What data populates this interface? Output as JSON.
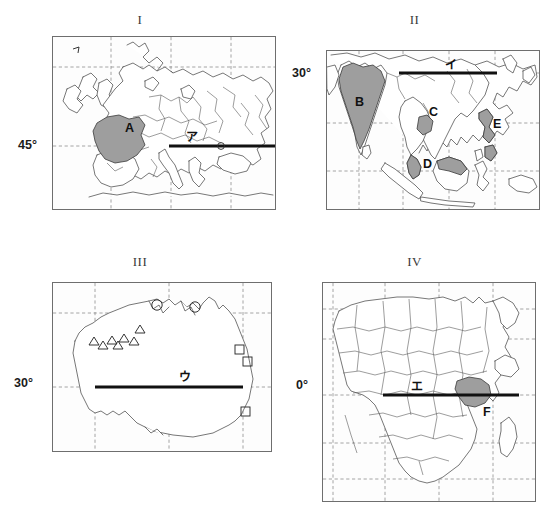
{
  "figure": {
    "caption": "Four world map panels with shaded countries and latitude reference lines",
    "panels": [
      {
        "id": "panel-1",
        "title": "I",
        "region": "Europe and Mediterranean",
        "latitude_label": "45°",
        "kana_label": "ア",
        "kana_romaji": "a",
        "shaded_regions": [
          {
            "letter": "A",
            "country": "France"
          }
        ],
        "small_marker_label": "イ"
      },
      {
        "id": "panel-2",
        "title": "II",
        "region": "South and Southeast Asia",
        "latitude_label": "30°",
        "kana_label": "イ",
        "kana_romaji": "i",
        "shaded_regions": [
          {
            "letter": "B",
            "country": "India"
          },
          {
            "letter": "C",
            "country": "Cambodia"
          },
          {
            "letter": "D",
            "country": "Malaysia"
          },
          {
            "letter": "E",
            "country": "Philippines"
          }
        ]
      },
      {
        "id": "panel-3",
        "title": "III",
        "region": "Australia",
        "latitude_label": "30°",
        "kana_label": "ウ",
        "kana_romaji": "u",
        "shaded_regions": [],
        "markers": {
          "triangle": {
            "symbol": "△",
            "count": 7,
            "area": "western Australia"
          },
          "circle": {
            "symbol": "○",
            "count": 2,
            "area": "northern Australia"
          },
          "square": {
            "symbol": "□",
            "count": 3,
            "area": "eastern Australia"
          }
        }
      },
      {
        "id": "panel-4",
        "title": "IV",
        "region": "Africa",
        "latitude_label": "0°",
        "kana_label": "エ",
        "kana_romaji": "e",
        "shaded_regions": [
          {
            "letter": "F",
            "country": "Kenya"
          }
        ]
      }
    ],
    "colors": {
      "shaded_fill": "#9e9e9e",
      "coastline": "#4a4a4a",
      "gridline": "#8d8d8d",
      "thick_latitude_line": "#111111",
      "frame": "#6e6e6e",
      "background": "#ffffff"
    }
  }
}
